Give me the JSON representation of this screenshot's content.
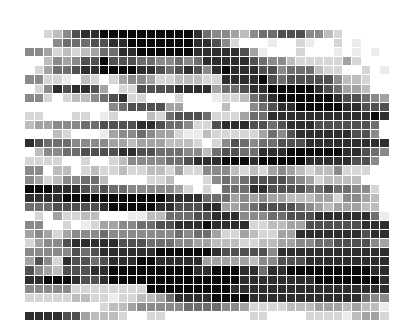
{
  "figure": {
    "type": "grayscale-pixel-grid",
    "columns": 40,
    "rows": 32,
    "scale": "0 = white, 9 = black",
    "palette": [
      "#ffffff",
      "#ececec",
      "#d6d6d6",
      "#bdbdbd",
      "#a3a3a3",
      "#8a8a8a",
      "#6e6e6e",
      "#505050",
      "#2e2e2e",
      "#0a0a0a"
    ],
    "grid": [
      "0002357889999999999865543566777553200000",
      "0000566677889999999887520001002100201000",
      "0554232346688999999888887410002000101010",
      "0003545779777665565688888765532222242000",
      "0024667889999887678758988877566632200201",
      "0552210320245542233322888897677777533200",
      "0025878874022777788884667889999987644300",
      "0552023356782200020001223678999999877654",
      "0000000000567777440000300567889999988777",
      "0220002201200032677762224668888888888898",
      "0344555667777887665227888776788877777760",
      "0000320001455654421132222246578888887750",
      "0876665555443444333202576566777888888888",
      "0035566777788776665536776688899999988765",
      "0222200200235555667888999899999888887750",
      "0550330232232233242255532324543233522200",
      "0542355663000022300025656777765423333000",
      "0999888767665555542020666887777667665520",
      "0888899999999999888866645454433344255430",
      "0666777778999998877788445677776543444330",
      "0020422330001133666778885556677788888861",
      "0550020124455667788898888223344777777888",
      "0454245556555555565664224322448888888788",
      "0245578888877766655443332233445566777754",
      "0555557678888889999998777775888888888888",
      "0475287767888998888844444355777888888888",
      "0754377788999999999889998868899999999988",
      "0889998778999999999999998888888899999998",
      "0555552222222299999999988888888888888888",
      "0222223322122334688889999888888888888655",
      "0000000002334555556666554222233344434331",
      "0888877433320022000000000220000222213442"
    ]
  }
}
